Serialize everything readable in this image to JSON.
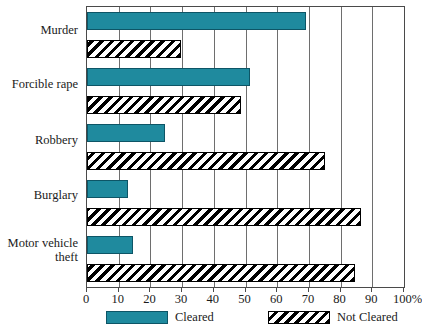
{
  "chart_data": {
    "type": "bar",
    "orientation": "horizontal",
    "title": "",
    "subtitle": "",
    "xlabel": "",
    "ylabel": "",
    "xlim": [
      0,
      100
    ],
    "xticks": [
      0,
      10,
      20,
      30,
      40,
      50,
      60,
      70,
      80,
      90,
      100
    ],
    "xtick_labels": [
      "0",
      "10",
      "20",
      "30",
      "40",
      "50",
      "60",
      "70",
      "80",
      "90",
      "100%"
    ],
    "grid": true,
    "grid_axis": "x",
    "legend_position": "bottom",
    "categories": [
      "Murder",
      "Forcible rape",
      "Robbery",
      "Burglary",
      "Motor vehicle theft"
    ],
    "series": [
      {
        "name": "Cleared",
        "color": "#1f8a9e",
        "pattern": "solid",
        "values": [
          69,
          51.5,
          24.5,
          13,
          14.5
        ]
      },
      {
        "name": "Not Cleared",
        "color": "#000000",
        "pattern": "diagonal-hatch",
        "values": [
          29.5,
          48.5,
          75,
          86.5,
          84.5
        ]
      }
    ]
  },
  "legend": {
    "entries": [
      {
        "label": "Cleared",
        "swatch": "solid-teal"
      },
      {
        "label": "Not Cleared",
        "swatch": "hatched"
      }
    ]
  },
  "axis": {
    "unit_suffix": "%"
  }
}
